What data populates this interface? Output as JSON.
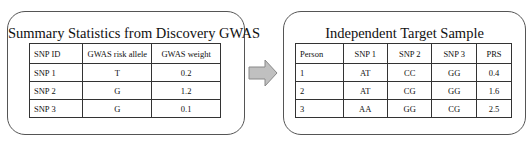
{
  "left_panel": {
    "title": "Summary Statistics from Discovery GWAS",
    "headers": [
      "SNP ID",
      "GWAS risk allele",
      "GWAS weight"
    ],
    "rows": [
      [
        "SNP 1",
        "T",
        "0.2"
      ],
      [
        "SNP 2",
        "G",
        "1.2"
      ],
      [
        "SNP 3",
        "G",
        "0.1"
      ]
    ]
  },
  "arrow": {
    "icon": "right-arrow-icon",
    "fill": "#c0c0c0",
    "stroke": "#888888"
  },
  "right_panel": {
    "title": "Independent Target Sample",
    "headers": [
      "Person",
      "SNP 1",
      "SNP 2",
      "SNP 3",
      "PRS"
    ],
    "rows": [
      [
        "1",
        "AT",
        "CC",
        "GG",
        "0.4"
      ],
      [
        "2",
        "AT",
        "CG",
        "GG",
        "1.6"
      ],
      [
        "3",
        "AA",
        "GG",
        "CG",
        "2.5"
      ]
    ]
  }
}
